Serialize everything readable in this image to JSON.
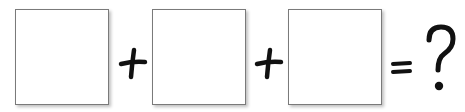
{
  "equation": {
    "boxes": [
      {
        "id": "box-1",
        "value": ""
      },
      {
        "id": "box-2",
        "value": ""
      },
      {
        "id": "box-3",
        "value": ""
      }
    ],
    "operators": [
      "+",
      "+",
      "="
    ],
    "result": "?",
    "colors": {
      "stroke": "#111111",
      "box_border": "#7a7a7a",
      "background": "#ffffff"
    }
  }
}
